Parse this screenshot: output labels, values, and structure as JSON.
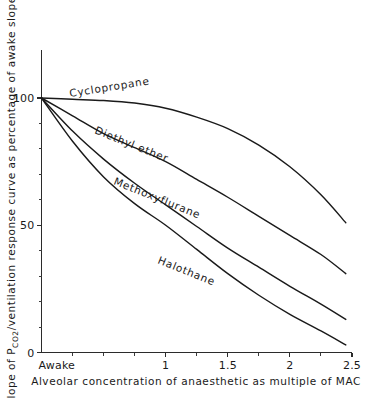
{
  "chart_data": {
    "type": "line",
    "title": "",
    "xlabel": "Alveolar concentration of anaesthetic as multiple of MAC",
    "ylabel_prefix": "Slope of P",
    "ylabel_sub": "CO2",
    "ylabel_suffix": "/ventilation response curve as percentage of awake slope",
    "ylabel_full": "Slope of PCO2/ventilation response curve as percentage of awake slope",
    "xlim": [
      0,
      2.5
    ],
    "ylim": [
      0,
      110
    ],
    "grid": false,
    "legend": "inline-curve-labels",
    "origin_tick_label": "Awake",
    "x_tick_labels": [
      "1",
      "1.5",
      "2",
      "2.5"
    ],
    "x_tick_values": [
      1,
      1.5,
      2,
      2.5
    ],
    "x_minor_ticks": [
      0.25,
      0.5,
      0.75,
      1.25,
      1.75,
      2.25
    ],
    "y_tick_labels": [
      "0",
      "50",
      "100"
    ],
    "y_tick_values": [
      0,
      50,
      100
    ],
    "y_minor_ticks": [
      10,
      20,
      30,
      40,
      60,
      70,
      80,
      90
    ],
    "x": [
      0,
      0.25,
      0.5,
      0.75,
      1,
      1.25,
      1.5,
      1.75,
      2,
      2.25,
      2.45
    ],
    "series": [
      {
        "name": "Cyclopropane",
        "label": "Cyclopropane",
        "label_rotation": -9,
        "values": [
          100,
          99.5,
          99,
          98,
          96,
          92.5,
          88,
          81.5,
          73,
          62,
          51
        ]
      },
      {
        "name": "Diethyl ether",
        "label": "Diethyl ether",
        "label_rotation": 22,
        "values": [
          100,
          93,
          86,
          80.5,
          75,
          68,
          61,
          53.5,
          46,
          38.5,
          31
        ]
      },
      {
        "name": "Methoxyflurane",
        "label": "Methoxyflurane",
        "label_rotation": 22,
        "values": [
          100,
          87,
          76,
          66.5,
          58,
          49.5,
          41,
          33.5,
          26,
          19,
          13
        ]
      },
      {
        "name": "Halothane",
        "label": "Halothane",
        "label_rotation": 22,
        "values": [
          100,
          83,
          69,
          58.5,
          50,
          40.5,
          31,
          22.5,
          15,
          8.5,
          3
        ]
      }
    ]
  }
}
